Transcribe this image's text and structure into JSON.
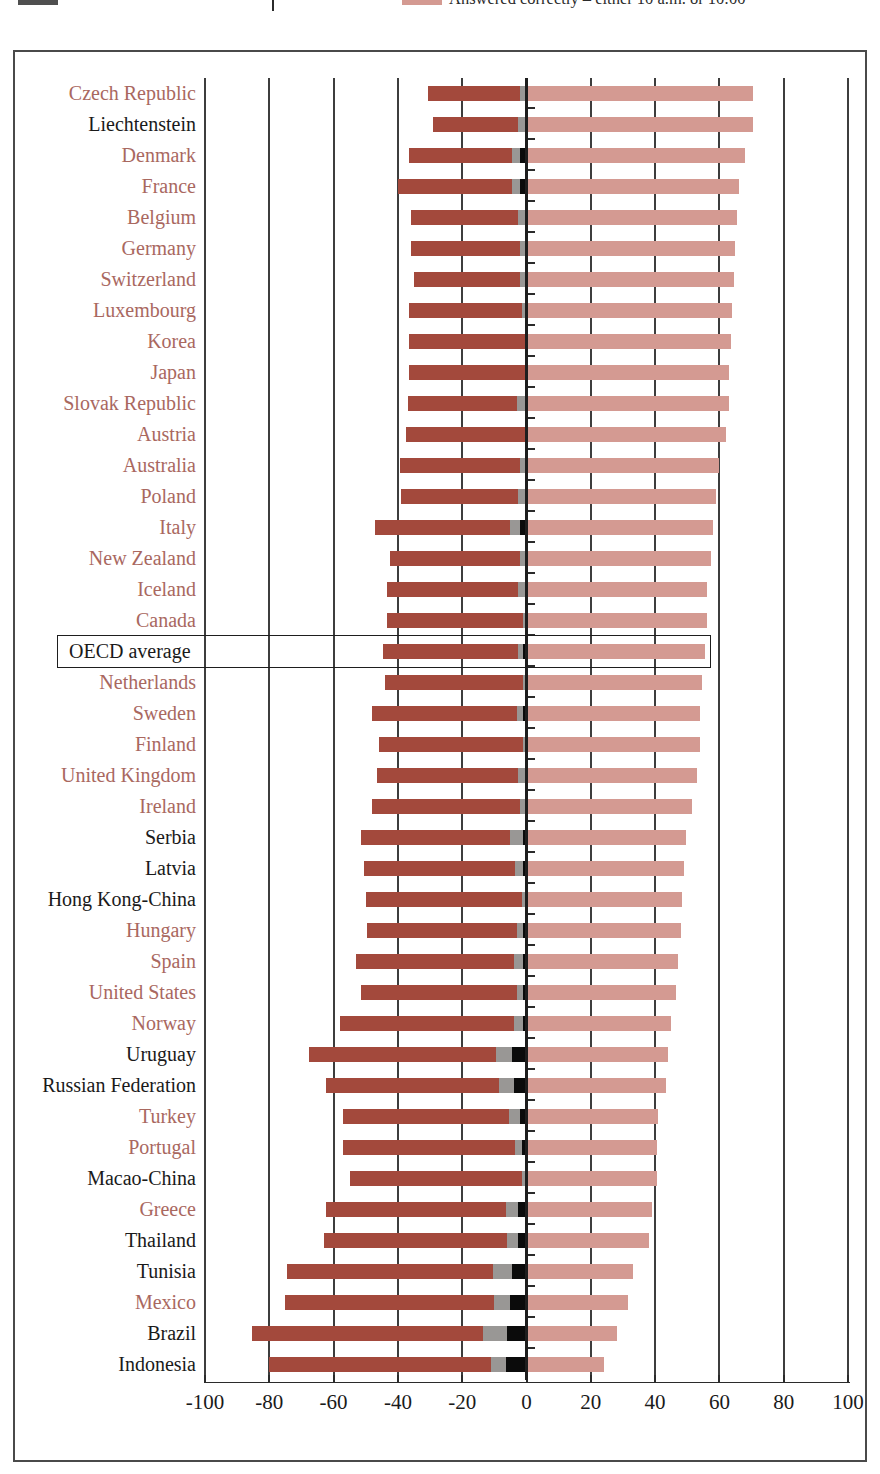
{
  "legend": {
    "entries": [
      {
        "label": "",
        "color": "#4f4f4f",
        "name": "legend-swatch-grey"
      },
      {
        "label": "",
        "color": "#ffffff",
        "name": "legend-swatch-blank"
      },
      {
        "label": "Answered correctly – either 10 a.m. or 10:00",
        "color": "#d49a92",
        "name": "legend-swatch-pink"
      }
    ]
  },
  "chart_data": {
    "type": "bar",
    "title": "",
    "subtitle": "",
    "xlabel": "",
    "ylabel": "",
    "xlim": [
      -100,
      100
    ],
    "xticks": [
      -100,
      -80,
      -60,
      -40,
      -20,
      0,
      20,
      40,
      60,
      80,
      100
    ],
    "xtick_labels": [
      "-100",
      "-80",
      "-60",
      "-40",
      "-20",
      "0",
      "20",
      "40",
      "60",
      "80",
      "100"
    ],
    "grid": true,
    "grid_axis": "x",
    "legend_position": "top",
    "orientation": "horizontal",
    "stacked": true,
    "diverging": true,
    "series": [
      {
        "name": "Answered incorrectly",
        "color": "#a3493c",
        "side": "left"
      },
      {
        "name": "No response / invalid",
        "color": "#999795",
        "side": "left"
      },
      {
        "name": "Not reached",
        "color": "#0b0b0b",
        "side": "left"
      },
      {
        "name": "Answered correctly – either 10 a.m. or 10:00",
        "color": "#d49a92",
        "side": "right"
      }
    ],
    "categories": [
      "Czech Republic",
      "Liechtenstein",
      "Denmark",
      "France",
      "Belgium",
      "Germany",
      "Switzerland",
      "Luxembourg",
      "Korea",
      "Japan",
      "Slovak Republic",
      "Austria",
      "Australia",
      "Poland",
      "Italy",
      "New Zealand",
      "Iceland",
      "Canada",
      "OECD average",
      "Netherlands",
      "Sweden",
      "Finland",
      "United Kingdom",
      "Ireland",
      "Serbia",
      "Latvia",
      "Hong Kong-China",
      "Hungary",
      "Spain",
      "United States",
      "Norway",
      "Uruguay",
      "Russian Federation",
      "Turkey",
      "Portugal",
      "Macao-China",
      "Greece",
      "Thailand",
      "Tunisia",
      "Mexico",
      "Brazil",
      "Indonesia"
    ],
    "category_groups": [
      "oecd",
      "partner",
      "oecd",
      "oecd",
      "oecd",
      "oecd",
      "oecd",
      "oecd",
      "oecd",
      "oecd",
      "oecd",
      "oecd",
      "oecd",
      "oecd",
      "oecd",
      "oecd",
      "oecd",
      "oecd",
      "average",
      "oecd",
      "oecd",
      "oecd",
      "oecd",
      "oecd",
      "partner",
      "partner",
      "partner",
      "oecd",
      "oecd",
      "oecd",
      "oecd",
      "partner",
      "partner",
      "oecd",
      "oecd",
      "partner",
      "oecd",
      "partner",
      "partner",
      "oecd",
      "partner",
      "partner"
    ],
    "rows": [
      {
        "category": "Czech Republic",
        "group": "oecd",
        "incorrect": 28.5,
        "no_response": 2.0,
        "not_reached": 0.0,
        "correct": 70.5
      },
      {
        "category": "Liechtenstein",
        "group": "partner",
        "incorrect": 26.5,
        "no_response": 2.5,
        "not_reached": 0.0,
        "correct": 70.5
      },
      {
        "category": "Denmark",
        "group": "oecd",
        "incorrect": 32.0,
        "no_response": 2.5,
        "not_reached": 2.0,
        "correct": 68.0
      },
      {
        "category": "France",
        "group": "oecd",
        "incorrect": 35.5,
        "no_response": 2.5,
        "not_reached": 2.0,
        "correct": 66.0
      },
      {
        "category": "Belgium",
        "group": "oecd",
        "incorrect": 33.5,
        "no_response": 2.0,
        "not_reached": 0.5,
        "correct": 65.5
      },
      {
        "category": "Germany",
        "group": "oecd",
        "incorrect": 34.0,
        "no_response": 1.5,
        "not_reached": 0.5,
        "correct": 65.0
      },
      {
        "category": "Switzerland",
        "group": "oecd",
        "incorrect": 33.0,
        "no_response": 1.5,
        "not_reached": 0.5,
        "correct": 64.5
      },
      {
        "category": "Luxembourg",
        "group": "oecd",
        "incorrect": 35.0,
        "no_response": 1.0,
        "not_reached": 0.5,
        "correct": 64.0
      },
      {
        "category": "Korea",
        "group": "oecd",
        "incorrect": 36.0,
        "no_response": 0.5,
        "not_reached": 0.0,
        "correct": 63.5
      },
      {
        "category": "Japan",
        "group": "oecd",
        "incorrect": 36.0,
        "no_response": 0.5,
        "not_reached": 0.0,
        "correct": 63.0
      },
      {
        "category": "Slovak Republic",
        "group": "oecd",
        "incorrect": 34.0,
        "no_response": 2.5,
        "not_reached": 0.5,
        "correct": 63.0
      },
      {
        "category": "Austria",
        "group": "oecd",
        "incorrect": 37.0,
        "no_response": 0.5,
        "not_reached": 0.0,
        "correct": 62.0
      },
      {
        "category": "Australia",
        "group": "oecd",
        "incorrect": 37.5,
        "no_response": 1.5,
        "not_reached": 0.5,
        "correct": 60.0
      },
      {
        "category": "Poland",
        "group": "oecd",
        "incorrect": 36.5,
        "no_response": 2.0,
        "not_reached": 0.5,
        "correct": 59.0
      },
      {
        "category": "Italy",
        "group": "oecd",
        "incorrect": 42.0,
        "no_response": 3.0,
        "not_reached": 2.0,
        "correct": 58.0
      },
      {
        "category": "New Zealand",
        "group": "oecd",
        "incorrect": 40.5,
        "no_response": 1.5,
        "not_reached": 0.5,
        "correct": 57.5
      },
      {
        "category": "Iceland",
        "group": "oecd",
        "incorrect": 41.0,
        "no_response": 2.0,
        "not_reached": 0.5,
        "correct": 56.0
      },
      {
        "category": "Canada",
        "group": "oecd",
        "incorrect": 42.5,
        "no_response": 1.0,
        "not_reached": 0.0,
        "correct": 56.0
      },
      {
        "category": "OECD average",
        "group": "average",
        "incorrect": 42.0,
        "no_response": 1.5,
        "not_reached": 1.0,
        "correct": 55.5
      },
      {
        "category": "Netherlands",
        "group": "oecd",
        "incorrect": 43.0,
        "no_response": 1.0,
        "not_reached": 0.0,
        "correct": 54.5
      },
      {
        "category": "Sweden",
        "group": "oecd",
        "incorrect": 45.0,
        "no_response": 2.0,
        "not_reached": 1.0,
        "correct": 54.0
      },
      {
        "category": "Finland",
        "group": "oecd",
        "incorrect": 45.0,
        "no_response": 1.0,
        "not_reached": 0.0,
        "correct": 54.0
      },
      {
        "category": "United Kingdom",
        "group": "oecd",
        "incorrect": 44.0,
        "no_response": 2.0,
        "not_reached": 0.5,
        "correct": 53.0
      },
      {
        "category": "Ireland",
        "group": "oecd",
        "incorrect": 46.0,
        "no_response": 1.5,
        "not_reached": 0.5,
        "correct": 51.5
      },
      {
        "category": "Serbia",
        "group": "partner",
        "incorrect": 46.5,
        "no_response": 4.0,
        "not_reached": 1.0,
        "correct": 49.5
      },
      {
        "category": "Latvia",
        "group": "partner",
        "incorrect": 47.0,
        "no_response": 2.5,
        "not_reached": 1.0,
        "correct": 49.0
      },
      {
        "category": "Hong Kong-China",
        "group": "partner",
        "incorrect": 48.5,
        "no_response": 1.5,
        "not_reached": 0.0,
        "correct": 48.5
      },
      {
        "category": "Hungary",
        "group": "oecd",
        "incorrect": 46.5,
        "no_response": 2.0,
        "not_reached": 1.0,
        "correct": 48.0
      },
      {
        "category": "Spain",
        "group": "oecd",
        "incorrect": 49.0,
        "no_response": 3.0,
        "not_reached": 1.0,
        "correct": 47.0
      },
      {
        "category": "United States",
        "group": "oecd",
        "incorrect": 48.5,
        "no_response": 2.0,
        "not_reached": 1.0,
        "correct": 46.5
      },
      {
        "category": "Norway",
        "group": "oecd",
        "incorrect": 54.0,
        "no_response": 3.0,
        "not_reached": 1.0,
        "correct": 45.0
      },
      {
        "category": "Uruguay",
        "group": "partner",
        "incorrect": 58.0,
        "no_response": 5.0,
        "not_reached": 4.5,
        "correct": 44.0
      },
      {
        "category": "Russian Federation",
        "group": "partner",
        "incorrect": 54.0,
        "no_response": 4.5,
        "not_reached": 4.0,
        "correct": 43.5
      },
      {
        "category": "Turkey",
        "group": "oecd",
        "incorrect": 51.5,
        "no_response": 3.5,
        "not_reached": 2.0,
        "correct": 41.0
      },
      {
        "category": "Portugal",
        "group": "oecd",
        "incorrect": 53.5,
        "no_response": 2.0,
        "not_reached": 1.5,
        "correct": 40.5
      },
      {
        "category": "Macao-China",
        "group": "partner",
        "incorrect": 53.5,
        "no_response": 1.0,
        "not_reached": 0.5,
        "correct": 40.5
      },
      {
        "category": "Greece",
        "group": "oecd",
        "incorrect": 56.0,
        "no_response": 4.0,
        "not_reached": 2.5,
        "correct": 39.0
      },
      {
        "category": "Thailand",
        "group": "partner",
        "incorrect": 57.0,
        "no_response": 3.5,
        "not_reached": 2.5,
        "correct": 38.0
      },
      {
        "category": "Tunisia",
        "group": "partner",
        "incorrect": 64.0,
        "no_response": 6.0,
        "not_reached": 4.5,
        "correct": 33.0
      },
      {
        "category": "Mexico",
        "group": "oecd",
        "incorrect": 65.0,
        "no_response": 5.0,
        "not_reached": 5.0,
        "correct": 31.5
      },
      {
        "category": "Brazil",
        "group": "partner",
        "incorrect": 72.0,
        "no_response": 7.5,
        "not_reached": 6.0,
        "correct": 28.0
      },
      {
        "category": "Indonesia",
        "group": "partner",
        "incorrect": 69.0,
        "no_response": 4.5,
        "not_reached": 6.5,
        "correct": 24.0
      }
    ]
  }
}
